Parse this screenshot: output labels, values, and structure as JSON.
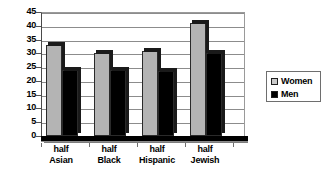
{
  "chart_data": {
    "type": "bar",
    "title": "",
    "subtitle": "",
    "xlabel": "",
    "ylabel": "",
    "categories": [
      "half Asian",
      "half Black",
      "half Hispanic",
      "half Jewish"
    ],
    "category_lines": [
      [
        "half",
        "Asian"
      ],
      [
        "half",
        "Black"
      ],
      [
        "half",
        "Hispanic"
      ],
      [
        "half",
        "Jewish"
      ]
    ],
    "series": [
      {
        "name": "Women",
        "values": [
          33,
          30,
          31,
          41
        ],
        "color": "#b4b4b4"
      },
      {
        "name": "Men",
        "values": [
          24,
          24,
          23.5,
          30
        ]
      }
    ],
    "ylim": [
      0,
      45
    ],
    "ytick_step": 5,
    "yticks": [
      0,
      5,
      10,
      15,
      20,
      25,
      30,
      35,
      40,
      45
    ],
    "ytick_labels": [
      "0",
      "5",
      "10",
      "15",
      "20",
      "25",
      "30",
      "35",
      "40",
      "45"
    ],
    "grid": true,
    "grid_axis": "y",
    "legend_position": "right",
    "style_3d": true
  },
  "legend": {
    "items": [
      {
        "label": "Women",
        "swatch": "women"
      },
      {
        "label": "Men",
        "swatch": "men"
      }
    ]
  },
  "colors": {
    "women_bar": "#b4b4b4",
    "men_bar": "#000000",
    "gridline": "#8c8c8c",
    "axis": "#4a4a4a",
    "background": "#ffffff",
    "text": "#000000"
  }
}
